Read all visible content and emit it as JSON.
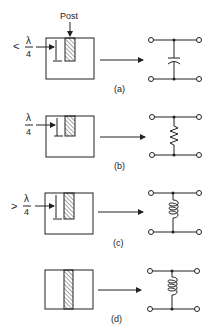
{
  "figure": {
    "post_label": "Post",
    "lambda_symbol": "λ",
    "denominator": "4",
    "panels": [
      {
        "id": "a",
        "caption": "(a)",
        "relation": "<",
        "post_depth": "less than quarter wavelength",
        "equivalent": "capacitor"
      },
      {
        "id": "b",
        "caption": "(b)",
        "relation": "",
        "post_depth": "quarter wavelength",
        "equivalent": "resistor"
      },
      {
        "id": "c",
        "caption": "(c)",
        "relation": ">",
        "post_depth": "greater than quarter wavelength",
        "equivalent": "inductor"
      },
      {
        "id": "d",
        "caption": "(d)",
        "relation": "",
        "post_depth": "full height",
        "equivalent": "inductor"
      }
    ]
  }
}
